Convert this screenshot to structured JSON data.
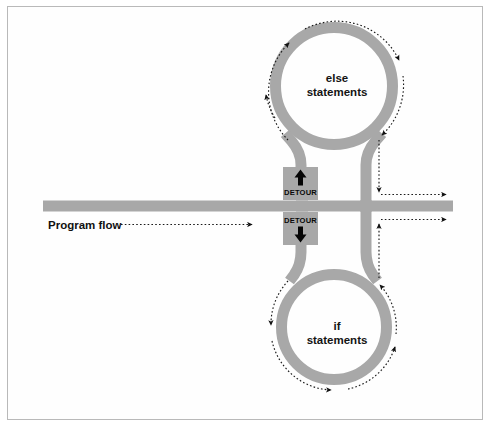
{
  "figure": {
    "kind": "flow-diagram",
    "background_color": "#ffffff",
    "frame_color": "#b9b9b9",
    "road_color": "#a8a8a8",
    "flow_color": "#111111"
  },
  "labels": {
    "program_flow": "Program flow",
    "else_line1": "else",
    "else_line2": "statements",
    "if_line1": "if",
    "if_line2": "statements"
  },
  "signs": {
    "upper": {
      "text": "DETOUR",
      "arrow_direction": "up"
    },
    "lower": {
      "text": "DETOUR",
      "arrow_direction": "down"
    }
  },
  "geometry": {
    "main_road": {
      "x1": 43,
      "x2": 453,
      "y": 206,
      "thickness": 11
    },
    "upper_loop": {
      "cx": 334,
      "cy": 86,
      "outer_r": 64,
      "thickness": 11
    },
    "lower_loop": {
      "cx": 334,
      "cy": 327,
      "outer_r": 58,
      "thickness": 11
    },
    "left_stem": {
      "x": 301,
      "thickness": 11
    },
    "right_stem": {
      "x": 366,
      "thickness": 11
    }
  },
  "flow_arrows": [
    {
      "name": "program-flow-inbound",
      "description": "dotted arrow pointing right along main road"
    },
    {
      "name": "upper-loop-ccw",
      "description": "dotted arrows circling the else loop"
    },
    {
      "name": "lower-loop-cw",
      "description": "dotted arrows circling the if loop"
    },
    {
      "name": "exit-upper-right",
      "description": "dotted arrow exiting right above the main road"
    },
    {
      "name": "exit-lower-right",
      "description": "dotted arrow exiting right below the main road"
    }
  ]
}
